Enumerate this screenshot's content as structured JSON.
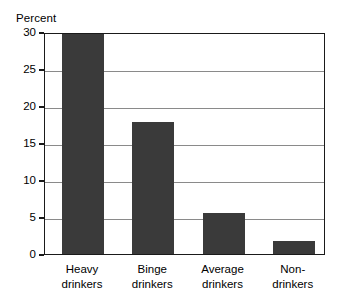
{
  "chart_data": {
    "type": "bar",
    "title": "",
    "xlabel": "",
    "ylabel": "Percent",
    "categories": [
      "Heavy drinkers",
      "Binge drinkers",
      "Average drinkers",
      "Non-drinkers"
    ],
    "category_lines": [
      [
        "Heavy",
        "drinkers"
      ],
      [
        "Binge",
        "drinkers"
      ],
      [
        "Average",
        "drinkers"
      ],
      [
        "Non-",
        "drinkers"
      ]
    ],
    "values": [
      29.7,
      17.8,
      5.5,
      1.8
    ],
    "ylim": [
      0,
      30
    ],
    "ytick_values": [
      0,
      5,
      10,
      15,
      20,
      25,
      30
    ],
    "ytick_labels": [
      "0",
      "5",
      "10",
      "15",
      "20",
      "25",
      "30"
    ],
    "grid": true,
    "grid_axis": "y",
    "legend": false,
    "bar_color": "#3a3a3a",
    "frame_color": "#1a1a1a",
    "grid_color": "#8a8a8a",
    "background_color": "#ffffff"
  }
}
